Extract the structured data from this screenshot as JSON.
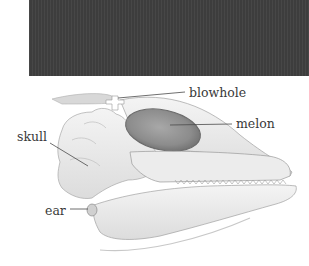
{
  "figure": {
    "labels": {
      "blowhole": "blowhole",
      "melon": "melon",
      "skull": "skull",
      "ear": "ear"
    }
  },
  "colors": {
    "dark_panel": "#3d3d3d",
    "background": "#ffffff",
    "melon": "#8a8a8a",
    "bone": "#e6e6e6",
    "outline": "#9a9a9a",
    "label_text": "#3a3a3a",
    "leader_line": "#4a4a4a"
  }
}
